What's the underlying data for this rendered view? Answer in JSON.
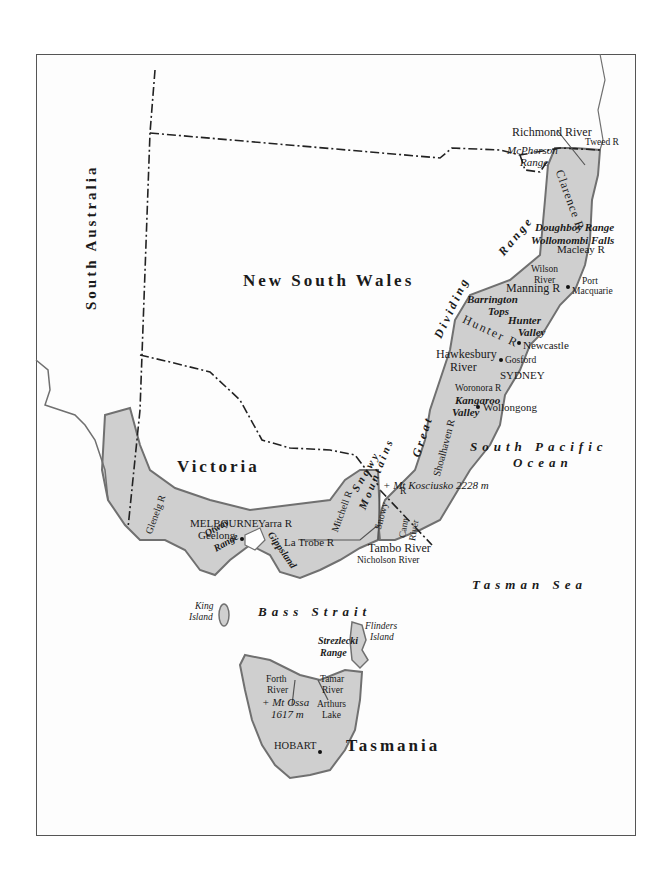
{
  "map": {
    "colors": {
      "land": "#cfcfcf",
      "coast": "#707070",
      "border": "#222222",
      "frame": "#555555"
    },
    "states": {
      "south_australia": "South Australia",
      "new_south_wales": "New South Wales",
      "victoria": "Victoria",
      "tasmania": "Tasmania"
    },
    "seas": {
      "south_pacific_line1": "South Pacific",
      "south_pacific_line2": "Ocean",
      "tasman_sea": "Tasman Sea",
      "bass_strait": "Bass Strait"
    },
    "ranges": {
      "great": "Great",
      "dividing": "Dividing",
      "range": "Range",
      "snowy": "Snowy",
      "mountains": "Mountains",
      "mcpherson_line1": "McPherson",
      "mcpherson_line2": "Range",
      "doughboy": "Doughboy Range",
      "barrington_line1": "Barrington",
      "barrington_line2": "Tops",
      "otway_line1": "Otway",
      "otway_line2": "Range",
      "strzelecki_line1": "Strezlecki",
      "strzelecki_line2": "Range"
    },
    "rivers": {
      "richmond": "Richmond River",
      "tweed": "Tweed R",
      "clarence": "Clarence R",
      "macleay": "Macleay R",
      "wilson_line1": "Wilson",
      "wilson_line2": "River",
      "manning": "Manning R",
      "hunter": "Hunter R",
      "hawkesbury_line1": "Hawkesbury",
      "hawkesbury_line2": "River",
      "woronora": "Woronora R",
      "shoalhaven": "Shoalhaven R",
      "snowy": "Snowy",
      "snowy_r": "R",
      "cann_line1": "Cann",
      "cann_line2": "River",
      "tambo": "Tambo River",
      "nicholson": "Nicholson River",
      "mitchell": "Mitchell R",
      "latrobe": "La Trobe R",
      "yarra": "Yarra R",
      "glenelg": "Glenelg R",
      "forth_line1": "Forth",
      "forth_line2": "River",
      "tamar_line1": "Tamar",
      "tamar_line2": "River"
    },
    "features": {
      "wollomombi": "Wollomombi Falls",
      "hunter_valley_line1": "Hunter",
      "hunter_valley_line2": "Valley",
      "kangaroo_line1": "Kangaroo",
      "kangaroo_line2": "Valley",
      "kosciusko": "+ Mt Kosciusko 2228 m",
      "gippsland": "Gippsland",
      "ossa_line1": "+ Mt Ossa",
      "ossa_line2": "1617 m",
      "arthurs_line1": "Arthurs",
      "arthurs_line2": "Lake",
      "king_line1": "King",
      "king_line2": "Island",
      "flinders_line1": "Flinders",
      "flinders_line2": "Island"
    },
    "cities": {
      "port_macquarie_line1": "Port",
      "port_macquarie_line2": "Macquarie",
      "newcastle": "Newcastle",
      "gosford": "Gosford",
      "sydney": "SYDNEY",
      "wollongong": "Wollongong",
      "melbourne": "MELBOURNE",
      "geelong": "Geelong",
      "hobart": "HOBART"
    }
  }
}
